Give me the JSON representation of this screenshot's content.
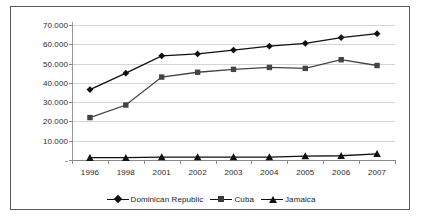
{
  "chart_data": {
    "type": "line",
    "title": "",
    "xlabel": "",
    "ylabel": "",
    "categories": [
      "1996",
      "1998",
      "2001",
      "2002",
      "2003",
      "2004",
      "2005",
      "2006",
      "2007"
    ],
    "ylim": [
      0,
      70000
    ],
    "ytick_labels": [
      "70.000",
      "60.000",
      "50.000",
      "40.000",
      "30.000",
      "20.000",
      "10.000",
      "-"
    ],
    "ytick_values": [
      70000,
      60000,
      50000,
      40000,
      30000,
      20000,
      10000,
      0
    ],
    "grid": true,
    "legend_position": "bottom",
    "series": [
      {
        "name": "Dominican Republic",
        "marker": "diamond",
        "color": "#111111",
        "values": [
          36500,
          45000,
          54000,
          55000,
          57000,
          59000,
          60500,
          63500,
          65500
        ]
      },
      {
        "name": "Cuba",
        "marker": "square",
        "color": "#444444",
        "values": [
          22000,
          28500,
          43000,
          45500,
          47000,
          48000,
          47500,
          52000,
          49000
        ]
      },
      {
        "name": "Jamaica",
        "marker": "triangle",
        "color": "#111111",
        "values": [
          1200,
          1200,
          1500,
          1500,
          1500,
          1500,
          2000,
          2200,
          3200
        ]
      }
    ]
  },
  "legend": {
    "items": [
      {
        "label": "Dominican Republic",
        "marker": "diamond"
      },
      {
        "label": "Cuba",
        "marker": "square"
      },
      {
        "label": "Jamaica",
        "marker": "triangle"
      }
    ]
  }
}
